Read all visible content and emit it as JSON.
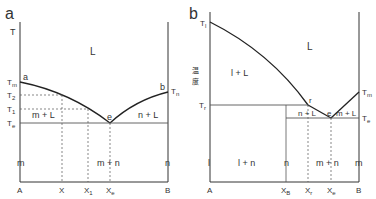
{
  "panel_a": {
    "letter": "a",
    "y_axis": "T",
    "region_L": "L",
    "region_mL": "m + L",
    "region_nL": "n + L",
    "region_mn": "m + n",
    "left_phase": "m",
    "right_phase": "n",
    "point_a": "a",
    "point_b": "b",
    "point_e": "e",
    "temps": {
      "Tm": "T",
      "Tm_sub": "m",
      "T2": "T",
      "T2_sub": "2",
      "T1": "T",
      "T1_sub": "1",
      "Te": "T",
      "Te_sub": "e",
      "Tn": "T",
      "Tn_sub": "n"
    },
    "x_labels": {
      "A": "A",
      "X": "X",
      "X1": "X",
      "X1_sub": "1",
      "Xe": "X",
      "Xe_sub": "e",
      "B": "B"
    }
  },
  "panel_b": {
    "letter": "b",
    "y_axis_label": "温度",
    "y_axis_char1": "温",
    "y_axis_char2": "度",
    "region_L": "L",
    "region_lL": "l + L",
    "region_nL": "n + L",
    "region_mL": "m + L",
    "region_ln": "l + n",
    "region_mn": "m + n",
    "left_phase": "l",
    "mid_phase": "n",
    "right_phase": "m",
    "point_r": "r",
    "point_e": "e",
    "temps": {
      "Tl": "T",
      "Tl_sub": "l",
      "Tr": "T",
      "Tr_sub": "r",
      "Tm": "T",
      "Tm_sub": "m",
      "Te": "T",
      "Te_sub": "e"
    },
    "x_labels": {
      "A": "A",
      "XB": "X",
      "XB_sub": "B",
      "Xr": "X",
      "Xr_sub": "r",
      "Xe": "X",
      "Xe_sub": "e",
      "B": "B"
    }
  }
}
